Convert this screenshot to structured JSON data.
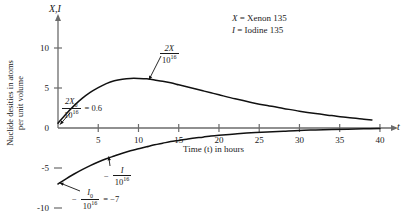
{
  "chart_data": {
    "type": "line",
    "title": "",
    "xlabel": "Time (t) in hours",
    "ylabel_line1": "Nuclide desities in atoms",
    "ylabel_line2": "per unit volume",
    "y_axis_title": "X,I",
    "x_axis_title": "t",
    "xlim": [
      0,
      41
    ],
    "ylim": [
      -11,
      11
    ],
    "xticks": [
      "5",
      "10",
      "15",
      "20",
      "25",
      "30",
      "35",
      "40"
    ],
    "xtick_values": [
      5,
      10,
      15,
      20,
      25,
      30,
      35,
      40
    ],
    "yticks": [
      "10",
      "5",
      "0",
      "-5",
      "-10"
    ],
    "ytick_values": [
      10,
      5,
      0,
      -5,
      -10
    ],
    "grid": false,
    "legend_position": "top-right",
    "series": [
      {
        "name": "2X/10^16",
        "x": [
          0,
          1,
          2,
          3,
          4,
          5,
          6,
          7,
          8,
          9,
          10,
          11,
          12,
          13,
          14,
          15,
          16,
          17,
          18,
          19,
          20,
          22,
          24,
          26,
          28,
          30,
          32,
          34,
          36,
          38,
          39
        ],
        "values": [
          0.6,
          1.75,
          2.8,
          3.7,
          4.45,
          5.05,
          5.55,
          5.9,
          6.1,
          6.2,
          6.2,
          6.15,
          6.0,
          5.85,
          5.65,
          5.4,
          5.15,
          4.9,
          4.65,
          4.4,
          4.15,
          3.65,
          3.2,
          2.8,
          2.45,
          2.1,
          1.8,
          1.55,
          1.3,
          1.1,
          1.0
        ]
      },
      {
        "name": "-I/10^16",
        "x": [
          0,
          1,
          2,
          3,
          4,
          5,
          6,
          7,
          8,
          9,
          10,
          11,
          12,
          13,
          14,
          15,
          16,
          17,
          18,
          19,
          20,
          22,
          24,
          26,
          28,
          30,
          32,
          34,
          36,
          38,
          40
        ],
        "values": [
          -7.0,
          -6.35,
          -5.75,
          -5.2,
          -4.7,
          -4.25,
          -3.85,
          -3.5,
          -3.15,
          -2.85,
          -2.6,
          -2.35,
          -2.1,
          -1.9,
          -1.7,
          -1.55,
          -1.4,
          -1.25,
          -1.15,
          -1.0,
          -0.9,
          -0.75,
          -0.6,
          -0.5,
          -0.4,
          -0.3,
          -0.25,
          -0.2,
          -0.15,
          -0.1,
          -0.05
        ]
      }
    ],
    "annotations": [
      {
        "id": "peak-label",
        "text": "2X / 10^16",
        "target_x": 11.5,
        "target_y": 6.2
      },
      {
        "id": "init-x-label",
        "text": "2X_0 / 10^16 = 0.6",
        "target_x": 0,
        "target_y": 0.6
      },
      {
        "id": "iodine-label",
        "text": "- I / 10^16",
        "target_x": 6.5,
        "target_y": -3.7
      },
      {
        "id": "init-i-label",
        "text": "- I_0 / 10^16 = -7",
        "target_x": 0,
        "target_y": -7
      }
    ]
  },
  "legend": {
    "entries": [
      {
        "symbol": "X",
        "eq": "=",
        "label": "Xenon 135"
      },
      {
        "symbol": "I",
        "eq": "=",
        "label": "Iodine 135"
      }
    ]
  },
  "axis_titles": {
    "y": "X,I",
    "x": "t",
    "x_caption": "Time (t) in hours",
    "y_caption_line1": "Nuclide desities in atoms",
    "y_caption_line2": "per unit volume"
  },
  "annotation_text": {
    "peak_num": "2X",
    "peak_den_base": "10",
    "peak_den_exp": "16",
    "initx_num_base": "2X",
    "initx_num_sub": "0",
    "initx_den_base": "10",
    "initx_den_exp": "16",
    "initx_value": "= 0.6",
    "iodine_minus": "−",
    "iodine_num": "I",
    "iodine_den_base": "10",
    "iodine_den_exp": "16",
    "initi_minus": "−",
    "initi_num_base": "I",
    "initi_num_sub": "0",
    "initi_den_base": "10",
    "initi_den_exp": "16",
    "initi_value": "= −7"
  },
  "ticks": {
    "x": [
      "5",
      "10",
      "15",
      "20",
      "25",
      "30",
      "35",
      "40"
    ],
    "y": [
      "10",
      "5",
      "0",
      "−5",
      "−10"
    ]
  },
  "colors": {
    "curve": "#111111",
    "axis": "#6b6b6b",
    "text": "#1a1a1a"
  }
}
